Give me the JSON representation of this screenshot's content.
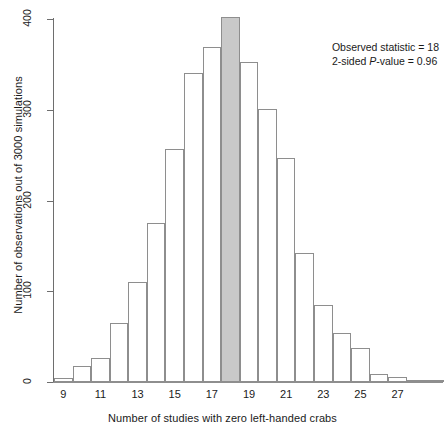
{
  "chart_data": {
    "type": "bar",
    "title": "",
    "subtitle": "",
    "xlabel": "Number of studies with zero left-handed crabs",
    "ylabel": "Number of observations out of 3000 simulations",
    "xlim": [
      8.5,
      29.5
    ],
    "ylim": [
      0,
      400
    ],
    "grid": false,
    "legend": null,
    "bin_width": 1,
    "categories": [
      9,
      10,
      11,
      12,
      13,
      14,
      15,
      16,
      17,
      18,
      19,
      20,
      21,
      22,
      23,
      24,
      25,
      26,
      27,
      28,
      29
    ],
    "values": [
      4,
      18,
      27,
      65,
      110,
      175,
      257,
      340,
      369,
      402,
      353,
      301,
      247,
      142,
      85,
      54,
      38,
      9,
      5,
      2,
      1
    ],
    "x_tick_labels": [
      "9",
      "11",
      "13",
      "15",
      "17",
      "19",
      "21",
      "23",
      "25",
      "27"
    ],
    "x_tick_values": [
      9,
      11,
      13,
      15,
      17,
      19,
      21,
      23,
      25,
      27
    ],
    "y_tick_labels": [
      "0",
      "100",
      "200",
      "300",
      "400"
    ],
    "y_tick_values": [
      0,
      100,
      200,
      300,
      400
    ],
    "highlight_category": 18,
    "highlight_color": "#c9c9c9",
    "bar_fill_color": "#ffffff",
    "bar_edge_color": "#8e8e8e",
    "annotations": [
      "Observed statistic = 18",
      "2-sided P-value = 0.96"
    ]
  },
  "annotation": {
    "observed_statistic_label": "Observed statistic = 18",
    "p_value_prefix": "2-sided ",
    "p_value_italic": "P",
    "p_value_suffix": "-value = 0.96"
  }
}
